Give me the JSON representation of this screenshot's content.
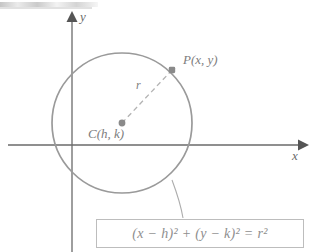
{
  "figure": {
    "axes": {
      "y_label": "y",
      "x_label": "x",
      "y_axis_name": "vertical axis",
      "x_axis_name": "horizontal axis",
      "axis_color": "#6a6a6a"
    },
    "circle": {
      "center_px": {
        "x": 122,
        "y": 123
      },
      "radius_px": 70,
      "stroke_color": "#9a9a9a"
    },
    "points": [
      {
        "id": "center",
        "label": "C(h, k)",
        "marker": "filled-dot",
        "px": {
          "x": 122,
          "y": 123
        }
      },
      {
        "id": "on-circle",
        "label": "P(x, y)",
        "marker": "filled-dot",
        "px": {
          "x": 172,
          "y": 70
        }
      }
    ],
    "radius_segment": {
      "label": "r",
      "style": "dashed",
      "color": "#b0b0b0"
    },
    "callout": {
      "equation": "(x − h)² + (y − k)² = r²",
      "border_color": "#bdbdbd",
      "text_color": "#8e8e8e",
      "leader_style": "curved-line"
    },
    "artifact": {
      "name": "scan-smudge",
      "description": "faint gray scan streak at top-left edge"
    }
  }
}
